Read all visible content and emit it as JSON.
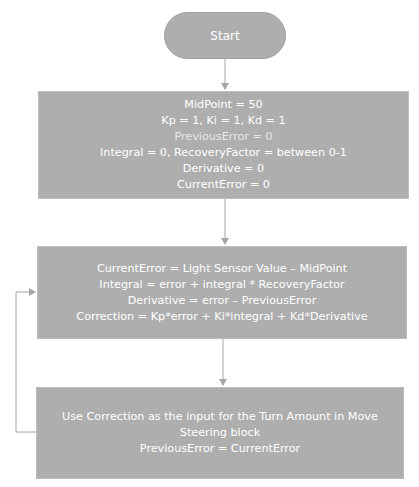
{
  "diagram": {
    "type": "flowchart",
    "colors": {
      "node_fill": "#aeaeae",
      "node_text": "#ffffff",
      "connector": "#a6a6a6",
      "background": "#ffffff"
    },
    "start": {
      "label": "Start"
    },
    "init_block": {
      "lines": [
        "MidPoint = 50",
        "Kp = 1, Ki = 1, Kd = 1",
        "PreviousError = 0",
        "Integral = 0, RecoveryFactor = between 0-1",
        "Derivative = 0",
        "CurrentError = 0"
      ]
    },
    "compute_block": {
      "lines": [
        "CurrentError = Light Sensor Value – MidPoint",
        "Integral = error + integral * RecoveryFactor",
        "Derivative = error – PreviousError",
        "Correction = Kp*error + Ki*integral + Kd*Derivative"
      ]
    },
    "apply_block": {
      "lines": [
        "Use Correction as the input for the Turn Amount in Move Steering block",
        "PreviousError = CurrentError"
      ]
    },
    "edges": [
      {
        "from": "start",
        "to": "init_block"
      },
      {
        "from": "init_block",
        "to": "compute_block"
      },
      {
        "from": "compute_block",
        "to": "apply_block"
      },
      {
        "from": "apply_block",
        "to": "compute_block",
        "kind": "loop-back"
      }
    ]
  }
}
